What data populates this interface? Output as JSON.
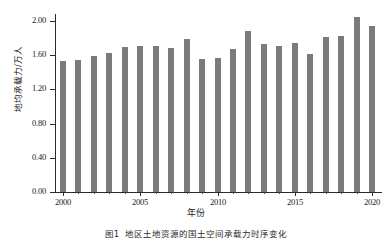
{
  "chart_data": {
    "type": "bar",
    "title": "",
    "xlabel": "年份",
    "ylabel": "地均承载力/万人",
    "categories": [
      "2000",
      "2001",
      "2002",
      "2003",
      "2004",
      "2005",
      "2006",
      "2007",
      "2008",
      "2009",
      "2010",
      "2011",
      "2012",
      "2013",
      "2014",
      "2015",
      "2016",
      "2017",
      "2018",
      "2019",
      "2020"
    ],
    "values": [
      1.53,
      1.54,
      1.59,
      1.63,
      1.7,
      1.71,
      1.71,
      1.69,
      1.79,
      1.56,
      1.57,
      1.67,
      1.88,
      1.73,
      1.71,
      1.74,
      1.61,
      1.81,
      1.83,
      2.05,
      1.94
    ],
    "ylim": [
      0.0,
      2.2
    ],
    "yticks": [
      0.0,
      0.4,
      0.8,
      1.2,
      1.6,
      2.0
    ],
    "ytick_labels": [
      "0.00",
      "0.40",
      "0.80",
      "1.20",
      "1.60",
      "2.00"
    ],
    "xticks": [
      2000,
      2005,
      2010,
      2015,
      2020
    ],
    "xtick_labels": [
      "2000",
      "2005",
      "2010",
      "2015",
      "2020"
    ],
    "grid": false,
    "legend": false,
    "bar_color": "#7b7b7b",
    "axis_color": "#2b2b2b"
  },
  "caption": {
    "number": "图1",
    "text": "地区土地资源的国土空间承载力时序变化"
  }
}
